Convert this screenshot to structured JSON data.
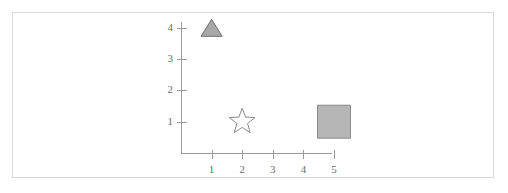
{
  "figure": {
    "background_color": "#ffffff",
    "border_color": "#d8d8d8"
  },
  "chart_data": {
    "type": "scatter",
    "title": "",
    "subtitle": "",
    "xlabel": "",
    "ylabel": "",
    "xlim": [
      0,
      5.5
    ],
    "ylim": [
      0,
      4.4
    ],
    "grid": false,
    "legend": null,
    "xticks": [
      1,
      2,
      3,
      4,
      5
    ],
    "xtick_labels": [
      "1",
      "2",
      "3",
      "4",
      "5"
    ],
    "yticks": [
      1,
      2,
      3,
      4
    ],
    "ytick_labels": [
      "1",
      "2",
      "3",
      "4"
    ],
    "axis_color": "#9a9a9a",
    "tick_label_color": "#6b6b6b",
    "points": [
      {
        "name": "triangle-marker",
        "x": 1,
        "y": 4,
        "marker": "triangle",
        "size": 17,
        "fill": "#a8a8a8",
        "stroke": "#6e6e6e",
        "filled": true
      },
      {
        "name": "star-marker",
        "x": 2,
        "y": 1,
        "marker": "star",
        "size": 27,
        "fill": "#ffffff",
        "stroke": "#8a8a8a",
        "filled": false
      },
      {
        "name": "square-marker",
        "x": 5,
        "y": 1,
        "marker": "square",
        "size": 33,
        "fill": "#b6b6b6",
        "stroke": "#8a8a8a",
        "filled": true
      }
    ]
  },
  "axis_geometry": {
    "origin_x": 181,
    "origin_y": 153,
    "y_axis_top": 22,
    "x_axis_right": 332,
    "x_step": 30.6,
    "y_step": 31.3,
    "tick_length": 9
  }
}
